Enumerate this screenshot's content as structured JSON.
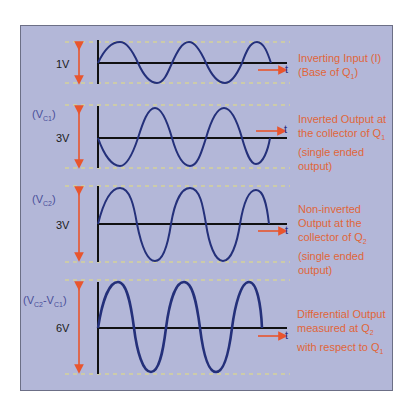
{
  "diagram": {
    "colors": {
      "background": "#b3b7d8",
      "wave": "#24307a",
      "axis": "#111111",
      "arrow": "#e8552e",
      "dashed": "#e6e07a",
      "description": "#e0663a",
      "signal_label": "#4a4f9a"
    },
    "time_axis_label": "t",
    "sections": [
      {
        "id": "inverting-input",
        "signal_label": "",
        "amplitude_label": "1V",
        "phase": "non-inverted",
        "description_lines": [
          "Inverting Input (I)",
          "(Base of Q",
          "1",
          ")"
        ],
        "description": "Inverting Input (I) (Base of Q1)"
      },
      {
        "id": "vc1",
        "signal_label_main": "(V",
        "signal_label_sub": "C1",
        "signal_label_end": ")",
        "amplitude_label": "3V",
        "phase": "inverted",
        "description": "Inverted Output at the collector of Q1 (single ended output)",
        "line1": "Inverted Output at",
        "line2": "the collector of Q",
        "line2_sub": "1",
        "line3": "(single ended",
        "line4": "output)"
      },
      {
        "id": "vc2",
        "signal_label_main": "(V",
        "signal_label_sub": "C2",
        "signal_label_end": ")",
        "amplitude_label": "3V",
        "phase": "non-inverted",
        "description": "Non-inverted Output at the collector of Q2 (single ended output)",
        "line1": "Non-inverted",
        "line2": "Output at the",
        "line3": "collector of Q",
        "line3_sub": "2",
        "line4": "(single ended",
        "line5": "output)"
      },
      {
        "id": "differential",
        "signal_label_a": "(V",
        "signal_label_a_sub": "C2",
        "signal_label_b": "-V",
        "signal_label_b_sub": "C1",
        "signal_label_end": ")",
        "amplitude_label": "6V",
        "phase": "non-inverted",
        "description": "Differential Output measured at Q2 with respect to Q1",
        "line1": "Differential Output",
        "line2": "measured at Q",
        "line2_sub": "2",
        "line3": "with respect to Q",
        "line3_sub": "1"
      }
    ],
    "section1_text": {
      "line1": "Inverting Input (I)",
      "line2": "(Base of Q",
      "line2_sub": "1",
      "line2_end": ")"
    }
  }
}
